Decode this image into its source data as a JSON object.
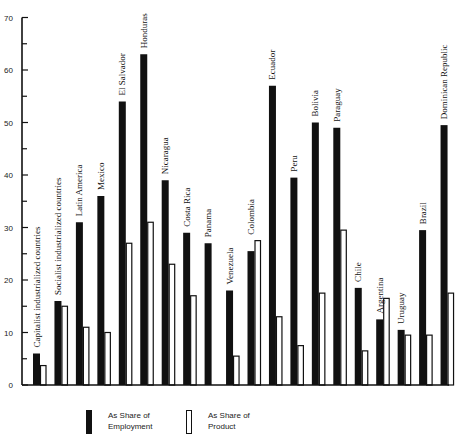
{
  "chart_data": {
    "type": "bar",
    "title": "",
    "xlabel": "",
    "ylabel": "",
    "ylim": [
      0,
      70
    ],
    "yticks": [
      0,
      10,
      20,
      30,
      40,
      50,
      60,
      70
    ],
    "grid": false,
    "legend_position": "bottom",
    "categories": [
      "Capitalist industrialized countries",
      "Socialist industrialized countries",
      "Latin America",
      "Mexico",
      "El Salvador",
      "Honduras",
      "Nicaragua",
      "Costa Rica",
      "Panama",
      "Venezuela",
      "Colombia",
      "Ecuador",
      "Peru",
      "Bolivia",
      "Paraguay",
      "Chile",
      "Argentina",
      "Uruguay",
      "Brazil",
      "Dominican Republic"
    ],
    "series": [
      {
        "name": "As Share of Employment",
        "color": "#111111",
        "values": [
          6,
          16,
          31,
          36,
          54,
          63,
          39,
          29,
          27,
          18,
          25.5,
          57,
          39.5,
          50,
          49,
          18.5,
          12.5,
          10.5,
          29.5,
          49.5
        ]
      },
      {
        "name": "As Share of Product",
        "color": "#ffffff",
        "values": [
          3.7,
          15,
          11,
          10,
          27,
          31,
          23,
          17,
          null,
          5.5,
          27.5,
          13,
          7.5,
          17.5,
          29.5,
          6.5,
          16.5,
          9.5,
          9.5,
          17.5
        ]
      }
    ]
  },
  "legend": {
    "employment_line1": "As Share of",
    "employment_line2": "Employment",
    "product_line1": "As Share of",
    "product_line2": "Product"
  }
}
